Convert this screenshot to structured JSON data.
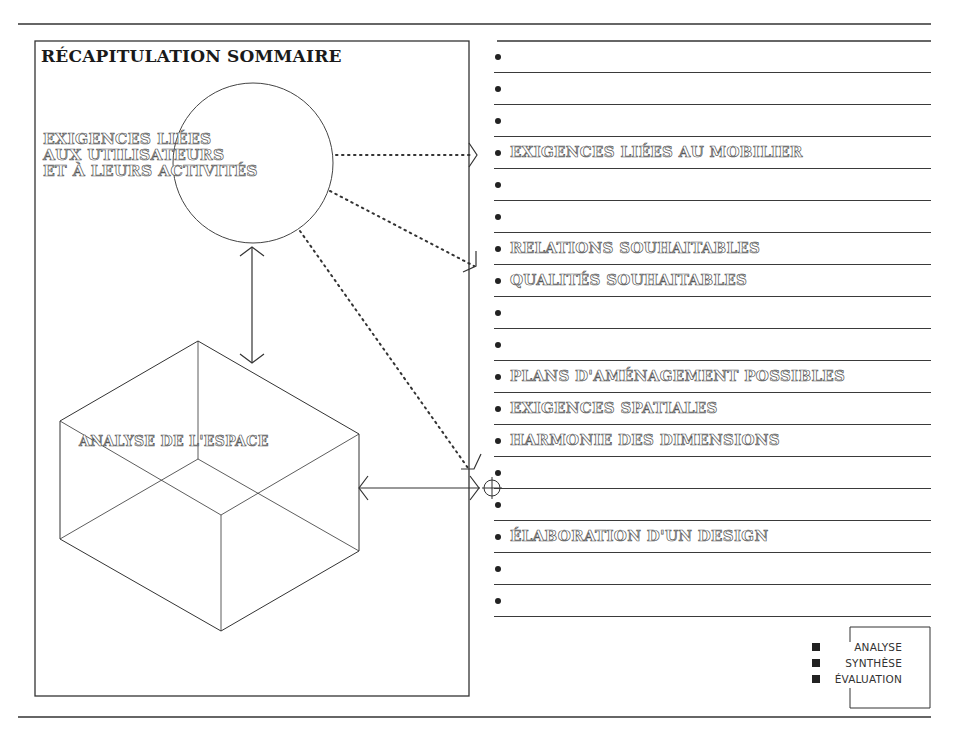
{
  "title": "RÉCAPITULATION SOMMAIRE",
  "circle_node": {
    "lines": [
      "EXIGENCES LIÉES",
      "AUX UTILISATEURS",
      "ET À LEURS ACTIVITÉS"
    ]
  },
  "cube_node": {
    "label": "ANALYSE DE L'ESPACE"
  },
  "checklist": {
    "rows": [
      {
        "label": ""
      },
      {
        "label": ""
      },
      {
        "label": ""
      },
      {
        "label": "EXIGENCES LIÉES AU MOBILIER"
      },
      {
        "label": ""
      },
      {
        "label": ""
      },
      {
        "label": "RELATIONS SOUHAITABLES"
      },
      {
        "label": "QUALITÉS SOUHAITABLES"
      },
      {
        "label": ""
      },
      {
        "label": ""
      },
      {
        "label": "PLANS D'AMÉNAGEMENT POSSIBLES"
      },
      {
        "label": "EXIGENCES SPATIALES"
      },
      {
        "label": "HARMONIE DES DIMENSIONS"
      },
      {
        "label": ""
      },
      {
        "label": ""
      },
      {
        "label": "ÉLABORATION D'UN DESIGN"
      },
      {
        "label": ""
      },
      {
        "label": ""
      }
    ]
  },
  "legend": {
    "items": [
      {
        "label": "ANALYSE"
      },
      {
        "label": "SYNTHÈSE"
      },
      {
        "label": "ÉVALUATION"
      }
    ]
  },
  "colors": {
    "ink": "#2a2a2a",
    "paper": "#ffffff"
  }
}
